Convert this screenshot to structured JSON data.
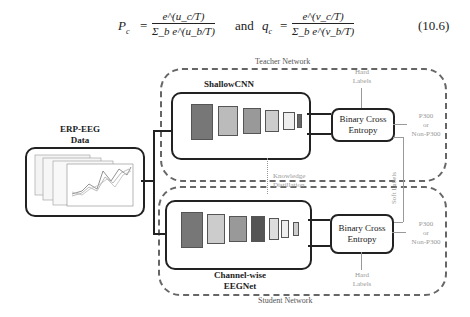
{
  "equation": {
    "p_lhs": "P",
    "p_sub": "c",
    "p_num": "e^(u_c/T)",
    "p_den": "Σ_b e^(u_b/T)",
    "connector": "and",
    "q_lhs": "q",
    "q_sub": "c",
    "q_num": "e^(v_c/T)",
    "q_den": "Σ_b e^(v_b/T)",
    "number": "(10.6)"
  },
  "diagram": {
    "input": {
      "title_line1": "ERP-EEG",
      "title_line2": "Data"
    },
    "teacher": {
      "group_label": "Teacher Network",
      "model_label": "ShallowCNN",
      "loss_label_line1": "Binary Cross",
      "loss_label_line2": "Entropy",
      "hard_labels_line1": "Hard",
      "hard_labels_line2": "Labels",
      "output_line1": "P300",
      "output_line2": "or",
      "output_line3": "Non-P300"
    },
    "distillation": {
      "line1": "Knowledge",
      "line2": "Distillation",
      "soft_labels": "Soft Labels"
    },
    "student": {
      "group_label": "Student Network",
      "model_label_line1": "Channel-wise",
      "model_label_line2": "EEGNet",
      "loss_label_line1": "Binary Cross",
      "loss_label_line2": "Entropy",
      "hard_labels_line1": "Hard",
      "hard_labels_line2": "Labels",
      "output_line1": "P300",
      "output_line2": "or",
      "output_line3": "Non-P300"
    },
    "colors": {
      "stroke": "#222222",
      "dashed": "#666666",
      "muted_text": "#999999"
    }
  }
}
